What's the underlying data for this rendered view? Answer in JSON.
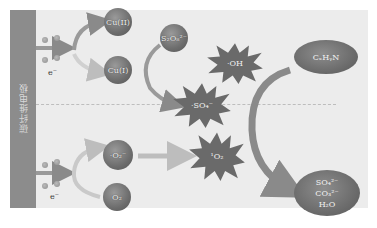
{
  "electrode": {
    "label": "碳纤维电极"
  },
  "electron_label": "e⁻",
  "upper_pathway": {
    "cu_high": "Cu(II)",
    "cu_low": "Cu(I)",
    "oxidant": "S₂O₈²⁻",
    "radical_oh": "·OH",
    "radical_so4": "·SO₄⁻",
    "pollutant": "CₓHᵧN"
  },
  "lower_pathway": {
    "superoxide": "·O₂⁻",
    "oxygen": "O₂",
    "singlet_oxygen": "¹O₂"
  },
  "products": [
    "SO₄²⁻",
    "CO₃²⁻",
    "H₂O"
  ],
  "colors": {
    "panel": "#ececec",
    "electrode": "#8c8c8c",
    "node_dark": "#6d6d6d",
    "arrow": "#8a8a8a"
  }
}
